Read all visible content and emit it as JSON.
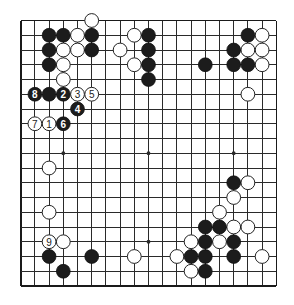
{
  "board": {
    "size": 19,
    "origin_x": 20.7,
    "origin_y": 20.5,
    "spacing_x": 14.2,
    "spacing_y": 14.75,
    "stone_radius": 6.9,
    "colors": {
      "line": "#2a2a2a",
      "black": "#1c1c1c",
      "white": "#ffffff",
      "background": "#ffffff"
    },
    "star_points": [
      [
        3,
        3
      ],
      [
        9,
        3
      ],
      [
        15,
        3
      ],
      [
        3,
        9
      ],
      [
        9,
        9
      ],
      [
        15,
        9
      ],
      [
        3,
        15
      ],
      [
        9,
        15
      ],
      [
        15,
        15
      ]
    ]
  },
  "stones": {
    "black": [
      [
        2,
        1
      ],
      [
        3,
        1
      ],
      [
        5,
        1
      ],
      [
        9,
        1
      ],
      [
        16,
        1
      ],
      [
        2,
        2
      ],
      [
        5,
        2
      ],
      [
        9,
        2
      ],
      [
        15,
        2
      ],
      [
        2,
        3
      ],
      [
        9,
        3
      ],
      [
        13,
        3
      ],
      [
        15,
        3
      ],
      [
        16,
        3
      ],
      [
        9,
        4
      ],
      [
        2,
        5
      ],
      [
        15,
        11
      ],
      [
        13,
        14
      ],
      [
        14,
        14
      ],
      [
        13,
        15
      ],
      [
        15,
        15
      ],
      [
        2,
        16
      ],
      [
        5,
        16
      ],
      [
        12,
        16
      ],
      [
        13,
        16
      ],
      [
        15,
        16
      ],
      [
        3,
        17
      ],
      [
        13,
        17
      ]
    ],
    "white": [
      [
        5,
        0
      ],
      [
        4,
        1
      ],
      [
        8,
        1
      ],
      [
        17,
        1
      ],
      [
        3,
        2
      ],
      [
        4,
        2
      ],
      [
        7,
        2
      ],
      [
        16,
        2
      ],
      [
        17,
        2
      ],
      [
        3,
        3
      ],
      [
        8,
        3
      ],
      [
        17,
        3
      ],
      [
        3,
        4
      ],
      [
        16,
        5
      ],
      [
        2,
        10
      ],
      [
        2,
        13
      ],
      [
        16,
        11
      ],
      [
        15,
        12
      ],
      [
        14,
        13
      ],
      [
        15,
        14
      ],
      [
        16,
        14
      ],
      [
        3,
        15
      ],
      [
        12,
        15
      ],
      [
        14,
        15
      ],
      [
        8,
        16
      ],
      [
        11,
        16
      ],
      [
        17,
        16
      ],
      [
        12,
        17
      ]
    ]
  },
  "moves": [
    {
      "number": "1",
      "color": "white",
      "x": 2,
      "y": 7
    },
    {
      "number": "2",
      "color": "black",
      "x": 3,
      "y": 5
    },
    {
      "number": "3",
      "color": "white",
      "x": 4,
      "y": 5
    },
    {
      "number": "4",
      "color": "black",
      "x": 4,
      "y": 6
    },
    {
      "number": "5",
      "color": "white",
      "x": 5,
      "y": 5
    },
    {
      "number": "6",
      "color": "black",
      "x": 3,
      "y": 7
    },
    {
      "number": "7",
      "color": "white",
      "x": 1,
      "y": 7
    },
    {
      "number": "8",
      "color": "black",
      "x": 1,
      "y": 5
    },
    {
      "number": "9",
      "color": "white",
      "x": 2,
      "y": 15
    }
  ]
}
